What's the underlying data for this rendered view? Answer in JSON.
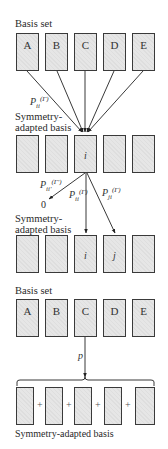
{
  "top_section": {
    "basis_label": "Basis set",
    "basis_boxes": [
      "A",
      "B",
      "C",
      "D",
      "E"
    ],
    "projector": {
      "base": "P",
      "sub": "ii",
      "sup": "(Γ)"
    },
    "sab_label_line1": "Symmetry-",
    "sab_label_line2": "adapted basis",
    "sab_boxes": [
      "",
      "",
      "i",
      "",
      ""
    ],
    "projections": [
      {
        "base": "P",
        "sub": "ii'",
        "sup": "(Γ')",
        "result": "0"
      },
      {
        "base": "P",
        "sub": "ii",
        "sup": "(Γ)"
      },
      {
        "base": "P",
        "sub": "ji",
        "sup": "(Γ)"
      }
    ],
    "sab2_label_line1": "Symmetry-",
    "sab2_label_line2": "adapted basis",
    "sab2_boxes": [
      "",
      "",
      "i",
      "j",
      ""
    ]
  },
  "bottom_section": {
    "basis_label": "Basis set",
    "basis_boxes": [
      "A",
      "B",
      "C",
      "D",
      "E"
    ],
    "operator": "p",
    "sum_operator": "+",
    "result_label": "Symmetry-adapted basis"
  },
  "colors": {
    "box_fill": "#e6e6e6",
    "box_border": "#3a3a3a",
    "arrow": "#222222"
  }
}
